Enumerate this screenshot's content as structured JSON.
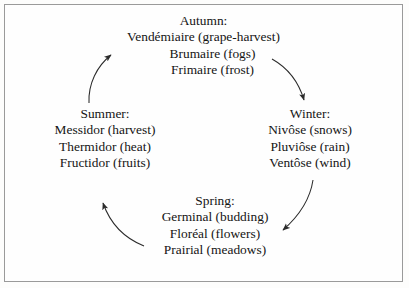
{
  "diagram": {
    "border_color": "#9a9a9a",
    "background_color": "#fefefe",
    "text_color": "#141414",
    "arrow_color": "#2b2b2b",
    "cycle_direction": "counterclockwise",
    "seasons": [
      {
        "id": "autumn",
        "heading": "Autumn:",
        "months": [
          "Vendémiaire (grape-harvest)",
          "Brumaire (fogs)",
          "Frimaire (frost)"
        ]
      },
      {
        "id": "winter",
        "heading": "Winter:",
        "months": [
          "Nivôse (snows)",
          "Pluviôse (rain)",
          "Ventôse (wind)"
        ]
      },
      {
        "id": "spring",
        "heading": "Spring:",
        "months": [
          "Germinal (budding)",
          "Floréal (flowers)",
          "Prairial (meadows)"
        ]
      },
      {
        "id": "summer",
        "heading": "Summer:",
        "months": [
          "Messidor (harvest)",
          "Thermidor (heat)",
          "Fructidor (fruits)"
        ]
      }
    ],
    "arrows": [
      {
        "id": "autumn-to-winter",
        "from": "autumn",
        "to": "winter"
      },
      {
        "id": "winter-to-spring",
        "from": "winter",
        "to": "spring"
      },
      {
        "id": "spring-to-summer",
        "from": "spring",
        "to": "summer"
      },
      {
        "id": "summer-to-autumn",
        "from": "summer",
        "to": "autumn"
      }
    ]
  }
}
